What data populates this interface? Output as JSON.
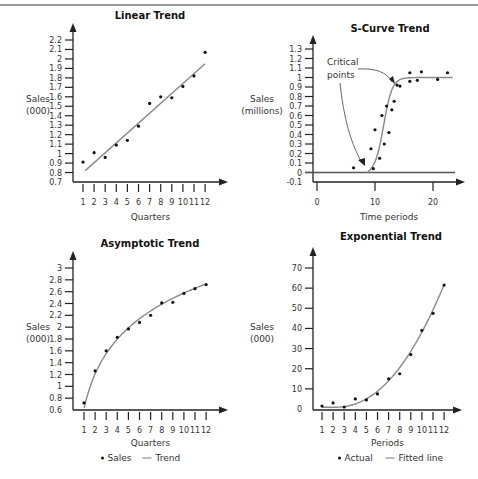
{
  "chart_data": [
    {
      "id": "linear",
      "type": "scatter",
      "title": "Linear Trend",
      "xlabel": "Quarters",
      "ylabel": [
        "Sales",
        "(000)"
      ],
      "x": [
        1,
        2,
        3,
        4,
        5,
        6,
        7,
        8,
        9,
        10,
        11,
        12
      ],
      "xticks": [
        "1",
        "2",
        "3",
        "4",
        "5",
        "6",
        "7",
        "8",
        "9",
        "10",
        "11",
        "12"
      ],
      "yticks": [
        "0.7",
        "0.8",
        "0.9",
        "1",
        "1.1",
        "1.2",
        "1.3",
        "1.4",
        "1.5",
        "1.6",
        "1.7",
        "1.8",
        "1.9",
        "2",
        "2.1",
        "2.2"
      ],
      "ylim": [
        0.7,
        2.2
      ],
      "series": [
        {
          "name": "Sales",
          "kind": "points",
          "values": [
            0.91,
            1.01,
            0.96,
            1.09,
            1.14,
            1.29,
            1.53,
            1.6,
            1.59,
            1.71,
            1.82,
            2.07
          ]
        },
        {
          "name": "Trend",
          "kind": "line",
          "from": [
            1.2,
            0.82
          ],
          "to": [
            12,
            1.95
          ]
        }
      ],
      "grid": false,
      "legend": null
    },
    {
      "id": "scurve",
      "type": "scatter",
      "title": "S-Curve Trend",
      "xlabel": "Time periods",
      "ylabel": [
        "Sales",
        "(millions)"
      ],
      "xticks": [
        "0",
        "10",
        "20"
      ],
      "yticks": [
        "-0.1",
        "0",
        "0.1",
        "0.2",
        "0.3",
        "0.4",
        "0.5",
        "0.6",
        "0.7",
        "0.8",
        "0.9",
        "1",
        "1.1",
        "1.2",
        "1.3"
      ],
      "xlim": [
        0,
        24
      ],
      "ylim": [
        -0.1,
        1.3
      ],
      "annotation": {
        "text": [
          "Critical",
          "points"
        ],
        "arrows_to": [
          [
            9.0,
            0.06
          ],
          [
            13.8,
            0.94
          ]
        ]
      },
      "series": [
        {
          "name": "Actual",
          "kind": "points",
          "x": [
            6.3,
            9.7,
            9.3,
            10.0,
            10.8,
            11.2,
            11.6,
            12.0,
            12.4,
            12.9,
            13.3,
            13.8,
            14.3,
            16.0,
            16.0,
            17.3,
            18.0,
            20.8,
            22.5
          ],
          "y": [
            0.05,
            0.04,
            0.25,
            0.45,
            0.15,
            0.6,
            0.3,
            0.7,
            0.42,
            0.66,
            0.75,
            0.92,
            0.91,
            1.05,
            0.96,
            0.97,
            1.06,
            0.98,
            1.05
          ]
        },
        {
          "name": "S-curve fit",
          "kind": "line",
          "shape": "logistic",
          "midpoint": 11.5,
          "plateau": 1.0,
          "start": 8.6
        }
      ],
      "grid": false,
      "legend": null
    },
    {
      "id": "asymptotic",
      "type": "scatter",
      "title": "Asymptotic Trend",
      "xlabel": "Quarters",
      "ylabel": [
        "Sales",
        "(000)"
      ],
      "x": [
        1,
        2,
        3,
        4,
        5,
        6,
        7,
        8,
        9,
        10,
        11,
        12
      ],
      "xticks": [
        "1",
        "2",
        "3",
        "4",
        "5",
        "6",
        "7",
        "8",
        "9",
        "10",
        "11",
        "12"
      ],
      "yticks": [
        "0.6",
        "0.8",
        "1",
        "1.2",
        "1.4",
        "1.6",
        "1.8",
        "2",
        "2.2",
        "2.4",
        "2.6",
        "2.8",
        "3"
      ],
      "ylim": [
        0.6,
        3.0
      ],
      "series": [
        {
          "name": "Sales",
          "kind": "points",
          "values": [
            0.72,
            1.26,
            1.6,
            1.83,
            1.97,
            2.08,
            2.2,
            2.41,
            2.42,
            2.57,
            2.65,
            2.72
          ]
        },
        {
          "name": "Trend",
          "kind": "line",
          "shape": "log"
        }
      ],
      "legend": {
        "position": "bottom",
        "items": [
          {
            "marker": "•",
            "label": "Sales"
          },
          {
            "marker": "—",
            "label": "Trend"
          }
        ]
      }
    },
    {
      "id": "exponential",
      "type": "scatter",
      "title": "Exponential Trend",
      "xlabel": "Periods",
      "ylabel": [
        "Sales",
        "(000)"
      ],
      "x": [
        1,
        2,
        3,
        4,
        5,
        6,
        7,
        8,
        9,
        10,
        11,
        12
      ],
      "xticks": [
        "1",
        "2",
        "3",
        "4",
        "5",
        "6",
        "7",
        "8",
        "9",
        "10",
        "11",
        "12"
      ],
      "yticks": [
        "0",
        "10",
        "20",
        "30",
        "40",
        "50",
        "60",
        "70"
      ],
      "ylim": [
        0,
        70
      ],
      "series": [
        {
          "name": "Actual",
          "kind": "points",
          "values": [
            1.5,
            3,
            1,
            5,
            4.5,
            7.5,
            15,
            17.5,
            27,
            39,
            47.5,
            61.5
          ]
        },
        {
          "name": "Fitted line",
          "kind": "line",
          "shape": "exponential"
        }
      ],
      "legend": {
        "position": "bottom",
        "items": [
          {
            "marker": "•",
            "label": "Actual"
          },
          {
            "marker": "—",
            "label": "Fitted line"
          }
        ]
      }
    }
  ],
  "colors": {
    "axis": "#222222",
    "points": "#111111",
    "line": "#8a8a8a",
    "topline": "#9a9a9a"
  }
}
